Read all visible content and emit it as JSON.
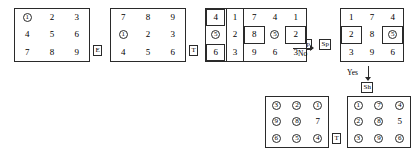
{
  "diagram": {
    "ink_color": "#2a2a2a",
    "background": "#ffffff",
    "grids": [
      {
        "id": "grid-1",
        "rows": [
          [
            {
              "v": "1",
              "circled": true,
              "boxed": false
            },
            {
              "v": "2",
              "circled": false,
              "boxed": false
            },
            {
              "v": "3",
              "circled": false,
              "boxed": false
            }
          ],
          [
            {
              "v": "4",
              "circled": false,
              "boxed": false
            },
            {
              "v": "5",
              "circled": false,
              "boxed": false
            },
            {
              "v": "6",
              "circled": false,
              "boxed": false
            }
          ],
          [
            {
              "v": "7",
              "circled": false,
              "boxed": false
            },
            {
              "v": "8",
              "circled": false,
              "boxed": false
            },
            {
              "v": "9",
              "circled": false,
              "boxed": false
            }
          ]
        ]
      },
      {
        "id": "grid-2",
        "rows": [
          [
            {
              "v": "7",
              "circled": false,
              "boxed": false
            },
            {
              "v": "8",
              "circled": false,
              "boxed": false
            },
            {
              "v": "9",
              "circled": false,
              "boxed": false
            }
          ],
          [
            {
              "v": "1",
              "circled": true,
              "boxed": false
            },
            {
              "v": "2",
              "circled": false,
              "boxed": false
            },
            {
              "v": "3",
              "circled": false,
              "boxed": false
            }
          ],
          [
            {
              "v": "4",
              "circled": false,
              "boxed": false
            },
            {
              "v": "5",
              "circled": false,
              "boxed": false
            },
            {
              "v": "6",
              "circled": false,
              "boxed": false
            }
          ]
        ]
      },
      {
        "id": "grid-3",
        "rows": [
          [
            {
              "v": "4",
              "circled": false,
              "boxed": true
            },
            {
              "v": "1",
              "circled": false,
              "boxed": false
            },
            {
              "v": "7",
              "circled": false,
              "boxed": false
            }
          ],
          [
            {
              "v": "5",
              "circled": true,
              "boxed": false
            },
            {
              "v": "2",
              "circled": false,
              "boxed": false
            },
            {
              "v": "8",
              "circled": false,
              "boxed": false
            }
          ],
          [
            {
              "v": "6",
              "circled": false,
              "boxed": true
            },
            {
              "v": "3",
              "circled": false,
              "boxed": false
            },
            {
              "v": "9",
              "circled": false,
              "boxed": false
            }
          ]
        ]
      },
      {
        "id": "grid-4",
        "rows": [
          [
            {
              "v": "7",
              "circled": false,
              "boxed": false
            },
            {
              "v": "4",
              "circled": false,
              "boxed": false
            },
            {
              "v": "1",
              "circled": false,
              "boxed": false
            }
          ],
          [
            {
              "v": "8",
              "circled": false,
              "boxed": true
            },
            {
              "v": "5",
              "circled": true,
              "boxed": false
            },
            {
              "v": "2",
              "circled": false,
              "boxed": true
            }
          ],
          [
            {
              "v": "9",
              "circled": false,
              "boxed": false
            },
            {
              "v": "6",
              "circled": false,
              "boxed": false
            },
            {
              "v": "3",
              "circled": false,
              "boxed": false
            }
          ]
        ]
      },
      {
        "id": "grid-5",
        "rows": [
          [
            {
              "v": "1",
              "circled": false,
              "boxed": false
            },
            {
              "v": "7",
              "circled": false,
              "boxed": false
            },
            {
              "v": "4",
              "circled": false,
              "boxed": false
            }
          ],
          [
            {
              "v": "2",
              "circled": false,
              "boxed": true
            },
            {
              "v": "8",
              "circled": false,
              "boxed": false
            },
            {
              "v": "5",
              "circled": true,
              "boxed": true
            }
          ],
          [
            {
              "v": "3",
              "circled": false,
              "boxed": false
            },
            {
              "v": "9",
              "circled": false,
              "boxed": false
            },
            {
              "v": "6",
              "circled": false,
              "boxed": false
            }
          ]
        ]
      },
      {
        "id": "grid-6",
        "rows": [
          [
            {
              "v": "3",
              "circled": true,
              "boxed": false
            },
            {
              "v": "2",
              "circled": true,
              "boxed": false
            },
            {
              "v": "1",
              "circled": true,
              "boxed": false
            }
          ],
          [
            {
              "v": "9",
              "circled": true,
              "boxed": false
            },
            {
              "v": "8",
              "circled": true,
              "boxed": false
            },
            {
              "v": "7",
              "circled": false,
              "boxed": false
            }
          ],
          [
            {
              "v": "6",
              "circled": true,
              "boxed": false
            },
            {
              "v": "5",
              "circled": true,
              "boxed": false
            },
            {
              "v": "4",
              "circled": true,
              "boxed": false
            }
          ]
        ]
      },
      {
        "id": "grid-7",
        "rows": [
          [
            {
              "v": "1",
              "circled": true,
              "boxed": false
            },
            {
              "v": "7",
              "circled": true,
              "boxed": false
            },
            {
              "v": "4",
              "circled": true,
              "boxed": false
            }
          ],
          [
            {
              "v": "2",
              "circled": true,
              "boxed": false
            },
            {
              "v": "8",
              "circled": true,
              "boxed": false
            },
            {
              "v": "5",
              "circled": false,
              "boxed": false
            }
          ],
          [
            {
              "v": "3",
              "circled": true,
              "boxed": false
            },
            {
              "v": "9",
              "circled": true,
              "boxed": false
            },
            {
              "v": "6",
              "circled": true,
              "boxed": false
            }
          ]
        ]
      }
    ],
    "keycaps": [
      {
        "id": "keycap-e",
        "label": "E"
      },
      {
        "id": "keycap-t-1",
        "label": "T"
      },
      {
        "id": "keycap-sp-1",
        "label": "Sp"
      },
      {
        "id": "keycap-sp-2",
        "label": "Sp"
      },
      {
        "id": "keycap-sh",
        "label": "Sh"
      },
      {
        "id": "keycap-t-2",
        "label": "T"
      }
    ],
    "arrow_labels": [
      {
        "id": "arrow-label-no-1",
        "text": "No"
      },
      {
        "id": "arrow-label-no-2",
        "text": "No"
      },
      {
        "id": "arrow-label-yes",
        "text": "Yes"
      }
    ]
  }
}
